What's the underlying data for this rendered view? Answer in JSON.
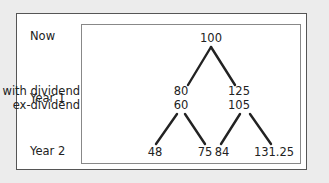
{
  "rows": {
    "now": "Now",
    "year1": "Year 1",
    "year2": "Year 2"
  },
  "annotations": {
    "with_dividend": "with dividend",
    "ex_dividend": "ex-dividend"
  },
  "nodes": {
    "root": "100",
    "down_with": "80",
    "up_with": "125",
    "down_ex": "60",
    "up_ex": "105",
    "dd": "48",
    "du": "75",
    "ud": "84",
    "uu": "131.25"
  }
}
